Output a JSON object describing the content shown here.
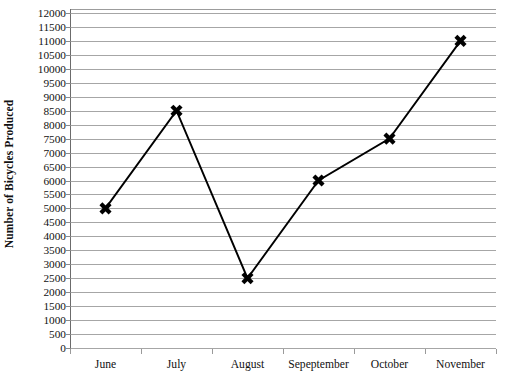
{
  "chart_data": {
    "type": "line",
    "title": "",
    "xlabel": "",
    "ylabel": "Number of Bicycles Produced",
    "categories": [
      "June",
      "July",
      "August",
      "Sepeptember",
      "October",
      "November"
    ],
    "values": [
      5000,
      8500,
      2500,
      6000,
      7500,
      11000
    ],
    "series": [
      {
        "name": "Number of Bicycles Produced",
        "values": [
          5000,
          8500,
          2500,
          6000,
          7500,
          11000
        ]
      }
    ],
    "ylim": [
      0,
      12000
    ],
    "y_tick_step": 500,
    "y_ticks": [
      0,
      500,
      1000,
      1500,
      2000,
      2500,
      3000,
      3500,
      4000,
      4500,
      5000,
      5500,
      6000,
      6500,
      7000,
      7500,
      8000,
      8500,
      9000,
      9500,
      10000,
      10500,
      11000,
      11500,
      12000
    ],
    "y_tick_labels": [
      "0",
      "500",
      "1000",
      "1500",
      "2000",
      "2500",
      "3000",
      "3500",
      "4000",
      "4500",
      "5000",
      "5500",
      "6000",
      "6500",
      "7000",
      "7500",
      "8000",
      "8500",
      "9000",
      "9500",
      "10000",
      "10500",
      "11000",
      "11500",
      "12000"
    ],
    "grid": true,
    "grid_axis": "y",
    "legend": false,
    "legend_position": "none",
    "marker": "x-cross",
    "line_color": "#000000",
    "marker_color": "#000000",
    "gridline_color": "#a6a6a6",
    "axis_color": "#6b6b6b",
    "background_color": "#ffffff"
  }
}
